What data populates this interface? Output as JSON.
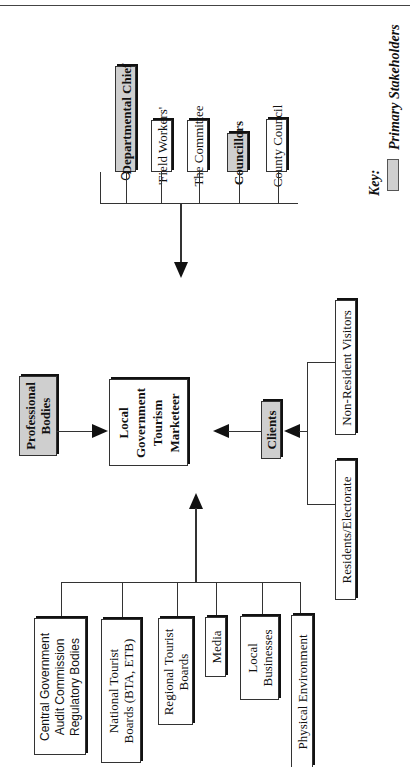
{
  "page": {
    "header_mark": ""
  },
  "diagram": {
    "center": {
      "label_lines": [
        "Local",
        "Government",
        "Tourism",
        "Marketeer"
      ]
    },
    "internal_stakeholders": [
      {
        "label": "Chief Executive",
        "primary": false
      },
      {
        "label": "Departmental Chief",
        "primary": true
      },
      {
        "label": "'Field Workers'",
        "primary": false
      },
      {
        "label": "The Committee",
        "primary": false
      },
      {
        "label": "Councillors",
        "primary": true
      },
      {
        "label": "County Council",
        "primary": false
      }
    ],
    "professional_bodies": {
      "label_lines": [
        "Professional",
        "Bodies"
      ],
      "primary": true
    },
    "clients": {
      "label": "Clients",
      "primary": true
    },
    "client_groups": [
      {
        "label": "Residents/Electorate",
        "primary": false
      },
      {
        "label": "Non-Resident Visitors",
        "primary": false
      }
    ],
    "external_stakeholders": [
      {
        "label_lines": [
          "Central Government",
          "Audit Commission",
          "Regulatory Bodies"
        ]
      },
      {
        "label_lines": [
          "National Tourist",
          "Boards (BTA, ETB)"
        ]
      },
      {
        "label_lines": [
          "Regional Tourist",
          "Boards"
        ]
      },
      {
        "label_lines": [
          "Media"
        ]
      },
      {
        "label_lines": [
          "Local",
          "Businesses"
        ]
      },
      {
        "label_lines": [
          "Physical Environment"
        ]
      }
    ],
    "key": {
      "title": "Key:",
      "swatch_label": "Primary Stakeholders",
      "swatch_color": "#cfcfcf"
    }
  }
}
